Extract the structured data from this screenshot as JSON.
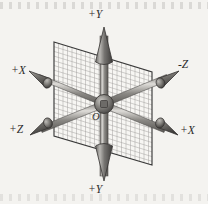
{
  "figure": {
    "background_color": "#f4f3f0",
    "ink_color": "#555353",
    "grid_color": "#8f8d8a",
    "plane_border_color": "#3a3a3a"
  },
  "labels": {
    "y_positive_top": "+Y",
    "y_positive_bottom": "+Y",
    "x_positive_upper_left": "+X",
    "z_negative_upper_right": "-Z",
    "z_positive_lower_left": "+Z",
    "x_positive_lower_right": "+X",
    "origin": "O"
  },
  "axes": [
    {
      "name": "y-up",
      "label": "+Y",
      "direction": "up",
      "tip": [
        104,
        28
      ],
      "tail": [
        104,
        104
      ]
    },
    {
      "name": "y-down",
      "label": "+Y",
      "direction": "down",
      "tip": [
        104,
        180
      ],
      "tail": [
        104,
        104
      ]
    },
    {
      "name": "x-upper-left",
      "label": "+X",
      "direction": "upper-left",
      "tip": [
        31,
        74
      ],
      "tail": [
        104,
        104
      ]
    },
    {
      "name": "z-upper-right",
      "label": "-Z",
      "direction": "upper-right",
      "tip": [
        176,
        70
      ],
      "tail": [
        104,
        104
      ]
    },
    {
      "name": "z-lower-left",
      "label": "+Z",
      "direction": "lower-left",
      "tip": [
        32,
        131
      ],
      "tail": [
        104,
        104
      ]
    },
    {
      "name": "x-lower-right",
      "label": "+X",
      "direction": "lower-right",
      "tip": [
        176,
        131
      ],
      "tail": [
        104,
        104
      ]
    }
  ],
  "plane": {
    "name": "grid-plane",
    "corners": [
      [
        54,
        42
      ],
      [
        152,
        72
      ],
      [
        152,
        165
      ],
      [
        54,
        136
      ]
    ],
    "grid_columns": 22,
    "grid_rows": 20
  },
  "origin_hub": {
    "center": [
      104,
      104
    ],
    "radius": 9
  }
}
